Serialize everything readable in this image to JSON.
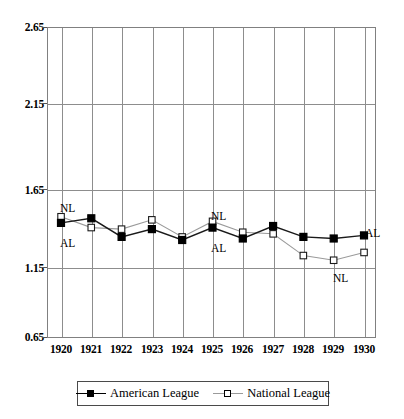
{
  "chart_data": {
    "type": "line",
    "title": "",
    "subtitle": "",
    "xlabel": "",
    "ylabel": "",
    "categories": [
      "1920",
      "1921",
      "1922",
      "1923",
      "1924",
      "1925",
      "1926",
      "1927",
      "1928",
      "1929",
      "1930"
    ],
    "x": [
      1920,
      1921,
      1922,
      1923,
      1924,
      1925,
      1926,
      1927,
      1928,
      1929,
      1930
    ],
    "xlim": [
      1920,
      1930
    ],
    "ylim": [
      0.65,
      2.65
    ],
    "yticks": [
      "0.65",
      "1.15",
      "1.65",
      "2.15",
      "2.65"
    ],
    "ytick_values": [
      0.65,
      1.15,
      1.65,
      2.15,
      2.65
    ],
    "grid": true,
    "legend_position": "bottom",
    "series": [
      {
        "name": "American League",
        "key": "AL",
        "marker": "filled-square",
        "color": "#000000",
        "values": [
          1.39,
          1.42,
          1.3,
          1.35,
          1.28,
          1.36,
          1.29,
          1.37,
          1.3,
          1.29,
          1.31
        ]
      },
      {
        "name": "National League",
        "key": "NL",
        "marker": "open-square",
        "color": "#000000",
        "values": [
          1.43,
          1.36,
          1.35,
          1.41,
          1.3,
          1.4,
          1.33,
          1.32,
          1.18,
          1.15,
          1.2
        ]
      }
    ],
    "annotations": [
      {
        "text": "NL",
        "x": 1920,
        "series": "NL",
        "position": "above"
      },
      {
        "text": "AL",
        "x": 1920,
        "series": "AL",
        "position": "below"
      },
      {
        "text": "NL",
        "x": 1925,
        "series": "NL",
        "position": "above"
      },
      {
        "text": "AL",
        "x": 1925,
        "series": "AL",
        "position": "below"
      },
      {
        "text": "NL",
        "x": 1929,
        "series": "NL",
        "position": "below"
      },
      {
        "text": "AL",
        "x": 1930,
        "series": "AL",
        "position": "above-right"
      }
    ]
  },
  "legend": {
    "entries": [
      {
        "label": "American League"
      },
      {
        "label": "National League"
      }
    ]
  },
  "colors": {
    "axis": "#808080",
    "grid": "#8d8d8d",
    "series": "#000000",
    "background": "#ffffff"
  }
}
